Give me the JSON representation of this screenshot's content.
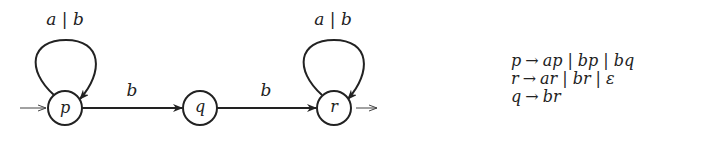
{
  "diagram": {
    "type": "finite-automaton",
    "states": [
      {
        "id": "p",
        "label": "p",
        "cx": 65,
        "cy": 108,
        "initial": true,
        "final": false
      },
      {
        "id": "q",
        "label": "q",
        "cx": 200,
        "cy": 108,
        "initial": false,
        "final": false
      },
      {
        "id": "r",
        "label": "r",
        "cx": 334,
        "cy": 108,
        "initial": false,
        "final": true
      }
    ],
    "transitions": [
      {
        "from": "p",
        "to": "p",
        "label": "a | b"
      },
      {
        "from": "p",
        "to": "q",
        "label": "b"
      },
      {
        "from": "q",
        "to": "r",
        "label": "b"
      },
      {
        "from": "r",
        "to": "r",
        "label": "a | b"
      }
    ],
    "labels": {
      "loop_p": "a | b",
      "edge_pq": "b",
      "edge_qr": "b",
      "loop_r": "a | b",
      "state_p": "p",
      "state_q": "q",
      "state_r": "r"
    }
  },
  "grammar": {
    "rules": [
      {
        "lhs": "p",
        "arrow": "→",
        "alternatives": [
          "ap",
          "bp",
          "bq"
        ]
      },
      {
        "lhs": "r",
        "arrow": "→",
        "alternatives": [
          "ar",
          "br",
          "ε"
        ]
      },
      {
        "lhs": "q",
        "arrow": "→",
        "alternatives": [
          "br"
        ]
      }
    ],
    "separator": "|"
  }
}
